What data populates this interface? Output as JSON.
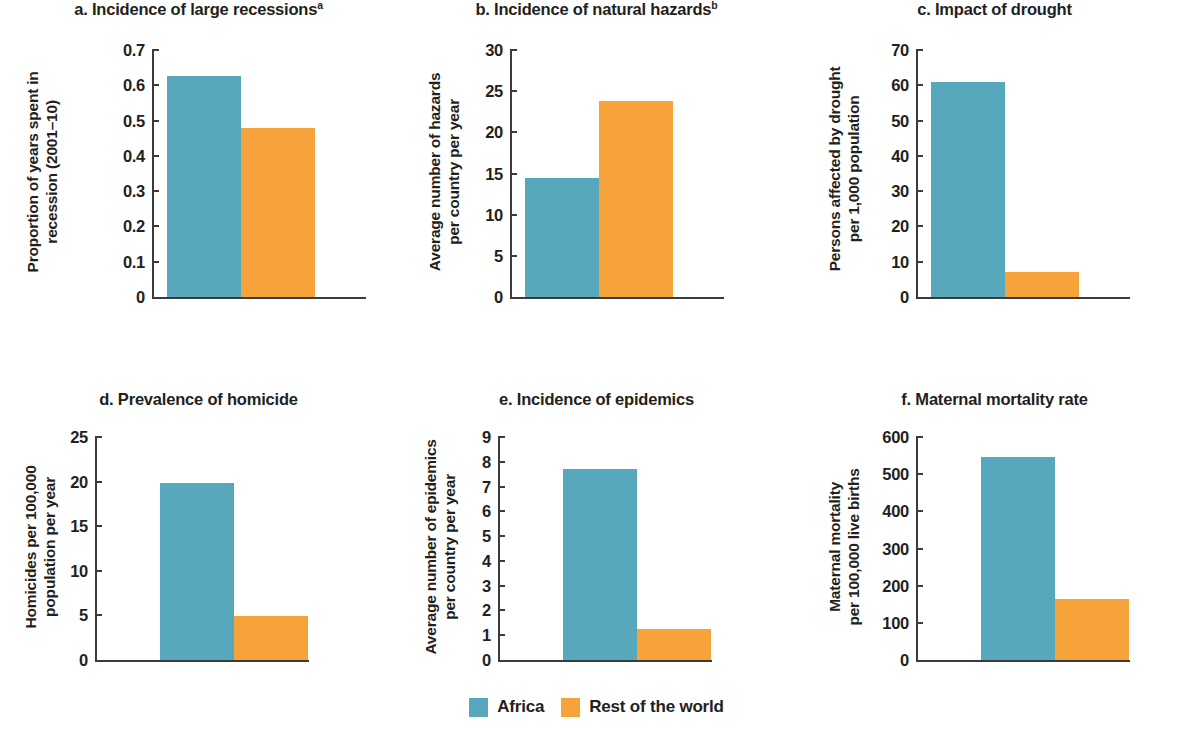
{
  "figure": {
    "legend": {
      "position": "bottom-center",
      "items": [
        {
          "label": "Africa",
          "color": "#57a8bd",
          "key": "africa"
        },
        {
          "label": "Rest of the world",
          "color": "#f5a33a",
          "key": "rest"
        }
      ]
    }
  },
  "chart_data": [
    {
      "type": "bar",
      "panel": "a",
      "title": "a. Incidence of large recessions",
      "title_superscript": "a",
      "ylabel": "Proportion of years spent in\nrecession (2001–10)",
      "xlabel": "",
      "categories": [
        "Africa",
        "Rest of the world"
      ],
      "series": [
        {
          "name": "Africa",
          "values": [
            0.625
          ],
          "color": "#57a8bd"
        },
        {
          "name": "Rest of the world",
          "values": [
            0.48
          ],
          "color": "#f5a33a"
        }
      ],
      "values": [
        0.625,
        0.48
      ],
      "ylim": [
        0,
        0.7
      ],
      "yticks": [
        0,
        0.1,
        0.2,
        0.3,
        0.4,
        0.5,
        0.6,
        0.7
      ],
      "ytick_labels": [
        "0",
        "0.1",
        "0.2",
        "0.3",
        "0.4",
        "0.5",
        "0.6",
        "0.7"
      ],
      "grid": false
    },
    {
      "type": "bar",
      "panel": "b",
      "title": "b. Incidence of natural hazards",
      "title_superscript": "b",
      "ylabel": "Average number of hazards\nper country per year",
      "xlabel": "",
      "categories": [
        "Africa",
        "Rest of the world"
      ],
      "series": [
        {
          "name": "Africa",
          "values": [
            14.5
          ],
          "color": "#57a8bd"
        },
        {
          "name": "Rest of the world",
          "values": [
            23.8
          ],
          "color": "#f5a33a"
        }
      ],
      "values": [
        14.5,
        23.8
      ],
      "ylim": [
        0,
        30
      ],
      "yticks": [
        0,
        5,
        10,
        15,
        20,
        25,
        30
      ],
      "ytick_labels": [
        "0",
        "5",
        "10",
        "15",
        "20",
        "25",
        "30"
      ],
      "grid": false
    },
    {
      "type": "bar",
      "panel": "c",
      "title": "c. Impact of drought",
      "title_superscript": "",
      "ylabel": "Persons affected by drought\nper 1,000 population",
      "xlabel": "",
      "categories": [
        "Africa",
        "Rest of the world"
      ],
      "series": [
        {
          "name": "Africa",
          "values": [
            61
          ],
          "color": "#57a8bd"
        },
        {
          "name": "Rest of the world",
          "values": [
            7
          ],
          "color": "#f5a33a"
        }
      ],
      "values": [
        61,
        7
      ],
      "ylim": [
        0,
        70
      ],
      "yticks": [
        0,
        10,
        20,
        30,
        40,
        50,
        60,
        70
      ],
      "ytick_labels": [
        "0",
        "10",
        "20",
        "30",
        "40",
        "50",
        "60",
        "70"
      ],
      "grid": false
    },
    {
      "type": "bar",
      "panel": "d",
      "title": "d. Prevalence of homicide",
      "title_superscript": "",
      "ylabel": "Homicides per 100,000\npopulation per year",
      "xlabel": "",
      "categories": [
        "Africa",
        "Rest of the world"
      ],
      "series": [
        {
          "name": "Africa",
          "values": [
            19.8
          ],
          "color": "#57a8bd"
        },
        {
          "name": "Rest of the world",
          "values": [
            4.9
          ],
          "color": "#f5a33a"
        }
      ],
      "values": [
        19.8,
        4.9
      ],
      "ylim": [
        0,
        25
      ],
      "yticks": [
        0,
        5,
        10,
        15,
        20,
        25
      ],
      "ytick_labels": [
        "0",
        "5",
        "10",
        "15",
        "20",
        "25"
      ],
      "grid": false
    },
    {
      "type": "bar",
      "panel": "e",
      "title": "e. Incidence of epidemics",
      "title_superscript": "",
      "ylabel": "Average number of epidemics\nper country per year",
      "xlabel": "",
      "categories": [
        "Africa",
        "Rest of the world"
      ],
      "series": [
        {
          "name": "Africa",
          "values": [
            7.7
          ],
          "color": "#57a8bd"
        },
        {
          "name": "Rest of the world",
          "values": [
            1.25
          ],
          "color": "#f5a33a"
        }
      ],
      "values": [
        7.7,
        1.25
      ],
      "ylim": [
        0,
        9
      ],
      "yticks": [
        0,
        1,
        2,
        3,
        4,
        5,
        6,
        7,
        8,
        9
      ],
      "ytick_labels": [
        "0",
        "1",
        "2",
        "3",
        "4",
        "5",
        "6",
        "7",
        "8",
        "9"
      ],
      "grid": false
    },
    {
      "type": "bar",
      "panel": "f",
      "title": "f. Maternal mortality rate",
      "title_superscript": "",
      "ylabel": "Maternal mortality\nper 100,000 live births",
      "xlabel": "",
      "categories": [
        "Africa",
        "Rest of the world"
      ],
      "series": [
        {
          "name": "Africa",
          "values": [
            545
          ],
          "color": "#57a8bd"
        },
        {
          "name": "Rest of the world",
          "values": [
            165
          ],
          "color": "#f5a33a"
        }
      ],
      "values": [
        545,
        165
      ],
      "ylim": [
        0,
        600
      ],
      "yticks": [
        0,
        100,
        200,
        300,
        400,
        500,
        600
      ],
      "ytick_labels": [
        "0",
        "100",
        "200",
        "300",
        "400",
        "500",
        "600"
      ],
      "grid": false
    }
  ]
}
